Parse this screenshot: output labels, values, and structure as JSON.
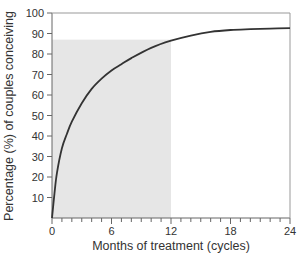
{
  "chart_data": {
    "type": "line",
    "title": "",
    "xlabel": "Months of treatment (cycles)",
    "ylabel": "Percentage (%) of couples conceiving",
    "xlim": [
      0,
      24
    ],
    "ylim": [
      0,
      100
    ],
    "x_ticks": [
      0,
      6,
      12,
      18,
      24
    ],
    "x_minor_tick_step": 1,
    "y_ticks": [
      10,
      20,
      30,
      40,
      50,
      60,
      70,
      80,
      90,
      100
    ],
    "grid": false,
    "legend": null,
    "series": [
      {
        "name": "Cumulative conception rate",
        "x": [
          0,
          0.25,
          0.5,
          1,
          1.5,
          2,
          3,
          4,
          5,
          6,
          7,
          8,
          10,
          12,
          14,
          16,
          18,
          20,
          22,
          24
        ],
        "values": [
          0,
          12,
          22,
          34,
          41,
          47,
          56,
          63,
          68,
          72,
          75,
          78,
          83,
          86.5,
          89,
          90.8,
          91.7,
          92.1,
          92.4,
          92.6
        ],
        "color": "#333333"
      }
    ],
    "annotations": [
      {
        "type": "shaded_region",
        "x_range": [
          0,
          12
        ],
        "y_range": [
          0,
          87
        ],
        "color": "#e6e6e6",
        "description": "Shaded area covering first 12 months up to ~87%"
      }
    ]
  },
  "colors": {
    "axis": "#666666",
    "curve": "#333333",
    "shading": "#e6e6e6",
    "text": "#333333"
  }
}
